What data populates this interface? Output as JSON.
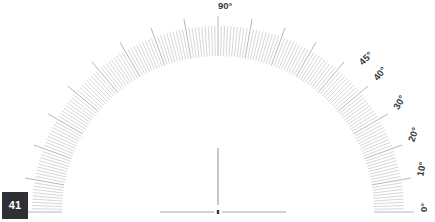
{
  "figure": {
    "kind": "radial-tick-scale",
    "title": "",
    "background_color": "#ffffff",
    "tick_color": "#b9bdc3",
    "major_tick_color": "#aab0b7",
    "label_color": "#3a3a3c",
    "baseline_color": "#a8a8ac",
    "center_dot_color": "#3a3a3c",
    "center": {
      "x": 218,
      "y": 212
    },
    "radii": {
      "inner": 156,
      "outer_minor": 186,
      "outer_major": 196,
      "label": 206
    },
    "angles": {
      "start_deg": 0,
      "end_deg": 180,
      "minor_step_deg": 1,
      "major_step_deg": 10
    },
    "center_line": {
      "from_y": 148,
      "to_y": 205,
      "x": 218
    },
    "baseline_left": {
      "x1": 160,
      "x2": 214,
      "y": 212
    },
    "baseline_right": {
      "x1": 222,
      "x2": 286,
      "y": 212
    },
    "labels": [
      {
        "text": "0°",
        "angle_deg": 0
      },
      {
        "text": "10°",
        "angle_deg": 10
      },
      {
        "text": "20°",
        "angle_deg": 20
      },
      {
        "text": "30°",
        "angle_deg": 30
      },
      {
        "text": "40°",
        "angle_deg": 40
      },
      {
        "text": "45°",
        "angle_deg": 46
      },
      {
        "text": "90°",
        "angle_deg": 90
      }
    ]
  },
  "badge": {
    "label": "41",
    "background_color": "#2e3033",
    "text_color": "#ffffff"
  },
  "chart_data": {
    "type": "line",
    "title": "",
    "subtitle": "",
    "xlabel": "",
    "ylabel": "",
    "legend": [],
    "annotations": [
      "41"
    ],
    "axis_kind": "polar-angular-semicircle",
    "axis_range_deg": [
      0,
      180
    ],
    "tick_labels": [
      "0°",
      "10°",
      "20°",
      "30°",
      "40°",
      "45°",
      "90°"
    ],
    "tick_label_angles_deg": [
      0,
      10,
      20,
      30,
      40,
      45,
      90
    ],
    "minor_tick_interval_deg": 1,
    "major_tick_interval_deg": 10,
    "grid": false,
    "series": []
  }
}
